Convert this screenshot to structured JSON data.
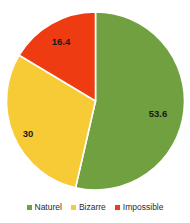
{
  "chart_data": {
    "type": "pie",
    "title": "",
    "categories": [
      "Naturel",
      "Bizarre",
      "Impossible"
    ],
    "values": [
      53.6,
      30,
      16.4
    ],
    "labels": [
      "53.6",
      "30",
      "16.4"
    ],
    "colors": [
      "#70a03f",
      "#f7cb35",
      "#ee3b12"
    ],
    "start_angle_deg": 0,
    "direction": "clockwise",
    "total": 100,
    "legend_position": "bottom",
    "grid": false,
    "background": "#ffffff",
    "label_color": "#1a1a1a",
    "separator_color": "#ffffff"
  },
  "legend": {
    "items": [
      {
        "label": "Naturel",
        "color": "#70a03f"
      },
      {
        "label": "Bizarre",
        "color": "#f7cb35"
      },
      {
        "label": "Impossible",
        "color": "#ee3b12"
      }
    ]
  },
  "slice_labels": {
    "naturel": "53.6",
    "bizarre": "30",
    "impossible": "16.4"
  }
}
